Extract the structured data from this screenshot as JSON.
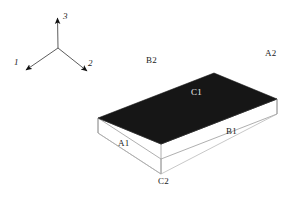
{
  "figure": {
    "title_caption": "",
    "background_color": "#ffffff",
    "top_face_color": "#161616",
    "side_face_color": "#ffffff",
    "outline_color": "#8c8c8c",
    "label_color": "#1a1a1a",
    "label_on_dark_color": "#f2f2f2"
  },
  "axes": {
    "origin_label": "",
    "items": [
      {
        "name": "axis-1",
        "label": "1",
        "direction": "down-left"
      },
      {
        "name": "axis-2",
        "label": "2",
        "direction": "down-right"
      },
      {
        "name": "axis-3",
        "label": "3",
        "direction": "up"
      }
    ]
  },
  "block": {
    "description": "rectangular slab in isometric view",
    "face_labels": [
      {
        "name": "label-b2",
        "text": "B2"
      },
      {
        "name": "label-a2",
        "text": "A2"
      },
      {
        "name": "label-c1",
        "text": "C1"
      },
      {
        "name": "label-b1",
        "text": "B1"
      },
      {
        "name": "label-a1",
        "text": "A1"
      },
      {
        "name": "label-c2",
        "text": "C2"
      }
    ]
  },
  "caption": {
    "text": ""
  }
}
